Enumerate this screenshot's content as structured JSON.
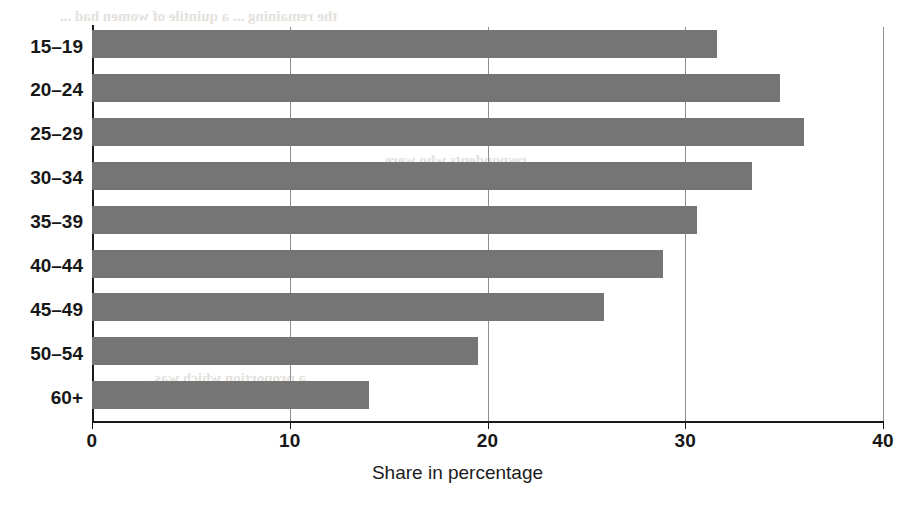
{
  "chart_data": {
    "type": "bar",
    "orientation": "horizontal",
    "title": "",
    "subtitle": "",
    "xlabel": "Share in percentage",
    "ylabel": "",
    "categories": [
      "15–19",
      "20–24",
      "25–29",
      "30–34",
      "35–39",
      "40–44",
      "45–49",
      "50–54",
      "60+"
    ],
    "values": [
      31.6,
      34.8,
      36.0,
      33.4,
      30.6,
      28.9,
      25.9,
      19.5,
      14.0
    ],
    "xlim": [
      0,
      40
    ],
    "xticks": [
      0,
      10,
      20,
      30,
      40
    ],
    "xtick_labels": [
      "0",
      "10",
      "20",
      "30",
      "40"
    ],
    "grid": "vertical",
    "legend": "none",
    "bar_color": "#757575",
    "axis_color": "#191919",
    "gridline_color": "#8e8e8e",
    "annotations": []
  },
  "axes": {
    "x_title": "Share in percentage"
  },
  "artifacts": {
    "bleed_top": "the remaining ... a quintile of women had ...",
    "bleed_mid": "respondents who were ...",
    "bleed_low": "a proportion which was ..."
  }
}
